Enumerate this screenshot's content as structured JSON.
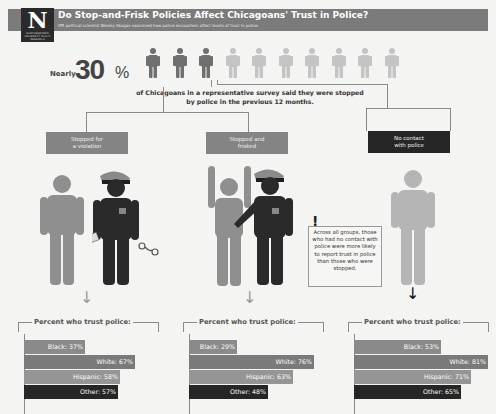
{
  "header": {
    "logo_letter": "N",
    "logo_sub": "NORTHWESTERN UNIVERSITY POLICY RESEARCH",
    "title": "Do Stop-and-Frisk Policies Affect Chicagoans' Trust in Police?",
    "subtitle": "IPR political scientist Wesley Skogan examined how police encounters affect levels of trust in police."
  },
  "stat": {
    "prefix": "Nearly",
    "value": "30",
    "unit": "%",
    "people_total": 10,
    "people_highlighted": 3,
    "caption_line1": "of Chicagoans in a representative survey said they were stopped",
    "caption_line2": "by police in the previous 12 months."
  },
  "categories": [
    {
      "label_line1": "Stopped for",
      "label_line2": "a violation",
      "color": "#848484"
    },
    {
      "label_line1": "Stopped and",
      "label_line2": "frisked",
      "color": "#848484"
    },
    {
      "label_line1": "No contact",
      "label_line2": "with police",
      "color": "#262626"
    }
  ],
  "note": {
    "icon": "exclamation-icon",
    "text": "Across all groups, those who had no contact with police were more likely to report trust in police than those who were stopped."
  },
  "colors": {
    "header": "#7b7b7b",
    "civilian": "#8f8f8f",
    "civilian_light": "#b5b5b5",
    "police": "#2a2a2a",
    "bar_black": "#8a8a8a",
    "bar_white": "#7a7a7a",
    "bar_hispanic": "#959595",
    "bar_other": "#262626"
  },
  "chart_data": [
    {
      "type": "bar",
      "title": "Percent who trust police:",
      "group": "Stopped for a violation",
      "categories": [
        "Black",
        "White",
        "Hispanic",
        "Other"
      ],
      "values": [
        37,
        67,
        58,
        57
      ],
      "labels": [
        "Black: 37%",
        "White: 67%",
        "Hispanic: 58%",
        "Other: 57%"
      ]
    },
    {
      "type": "bar",
      "title": "Percent who trust police:",
      "group": "Stopped and frisked",
      "categories": [
        "Black",
        "White",
        "Hispanic",
        "Other"
      ],
      "values": [
        29,
        76,
        63,
        48
      ],
      "labels": [
        "Black: 29%",
        "White: 76%",
        "Hispanic: 63%",
        "Other: 48%"
      ]
    },
    {
      "type": "bar",
      "title": "Percent who trust police:",
      "group": "No contact with police",
      "categories": [
        "Black",
        "White",
        "Hispanic",
        "Other"
      ],
      "values": [
        53,
        81,
        71,
        65
      ],
      "labels": [
        "Black: 53%",
        "White: 81%",
        "Hispanic: 71%",
        "Other: 65%"
      ]
    }
  ]
}
